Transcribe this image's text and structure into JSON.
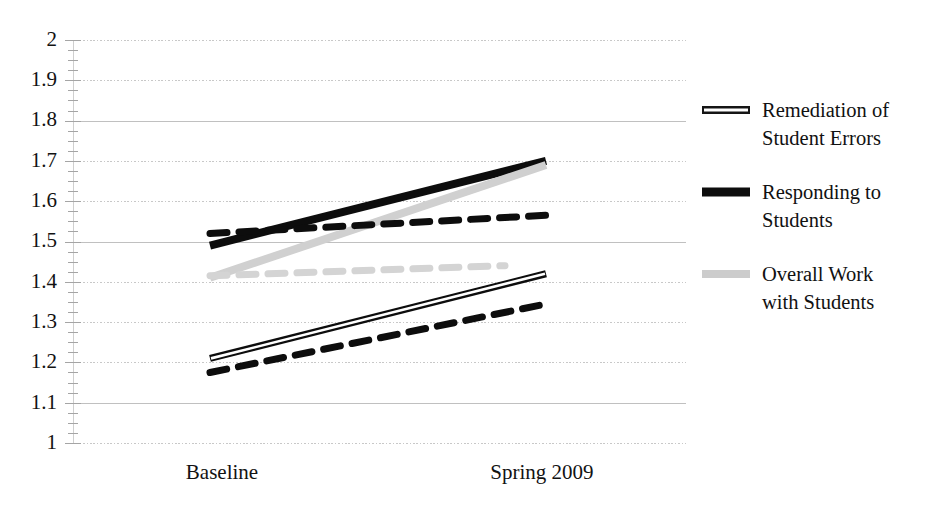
{
  "chart_data": {
    "type": "line",
    "title": "",
    "xlabel": "",
    "ylabel": "",
    "categories": [
      "Baseline",
      "Spring 2009"
    ],
    "ylim": [
      1,
      2
    ],
    "ytick_labels": [
      "2",
      "1.9",
      "1.8",
      "1.7",
      "1.6",
      "1.5",
      "1.4",
      "1.3",
      "1.2",
      "1.1",
      "1"
    ],
    "ytick_values": [
      2,
      1.9,
      1.8,
      1.7,
      1.6,
      1.5,
      1.4,
      1.3,
      1.2,
      1.1,
      1
    ],
    "grid": "horizontal",
    "legend_position": "right",
    "series": [
      {
        "name": "Remediation of Student Errors",
        "style": "solid-thin-outline",
        "color": "#0d0d0d",
        "values": [
          1.21,
          1.42
        ]
      },
      {
        "name": "Responding to Students",
        "style": "solid-thick",
        "color": "#0d0d0d",
        "values": [
          1.49,
          1.7
        ]
      },
      {
        "name": "Overall Work with Students",
        "style": "solid-thick",
        "color": "#d0d0d0",
        "values": [
          1.41,
          1.69
        ]
      },
      {
        "name": "Remediation of Student Errors (dashed)",
        "style": "dashed",
        "color": "#0d0d0d",
        "values": [
          1.175,
          1.345
        ]
      },
      {
        "name": "Responding to Students (dashed)",
        "style": "dashed",
        "color": "#0d0d0d",
        "values": [
          1.52,
          1.565
        ]
      },
      {
        "name": "Overall Work with Students (dashed)",
        "style": "dashed",
        "color": "#d4d4d4",
        "values": [
          1.415,
          1.44
        ]
      }
    ]
  },
  "axes": {
    "y_labels": [
      "2",
      "1.9",
      "1.8",
      "1.7",
      "1.6",
      "1.5",
      "1.4",
      "1.3",
      "1.2",
      "1.1",
      "1"
    ],
    "x_labels": [
      "Baseline",
      "Spring 2009"
    ]
  },
  "legend": {
    "items": [
      {
        "label_line1": "Remediation of",
        "label_line2": "Student Errors",
        "swatch": "double-thin-line",
        "color": "#151515"
      },
      {
        "label_line1": "Responding to",
        "label_line2": "Students",
        "swatch": "thick-solid-line",
        "color": "#0d0d0d"
      },
      {
        "label_line1": "Overall Work",
        "label_line2": "with Students",
        "swatch": "thick-light-line",
        "color": "#cccccc"
      }
    ]
  },
  "colors": {
    "dark": "#0d0d0d",
    "light_gray": "#d0d0d0",
    "gridline": "#c8c8c8",
    "gridline_solid": "#c0c0c0",
    "background": "#ffffff"
  }
}
